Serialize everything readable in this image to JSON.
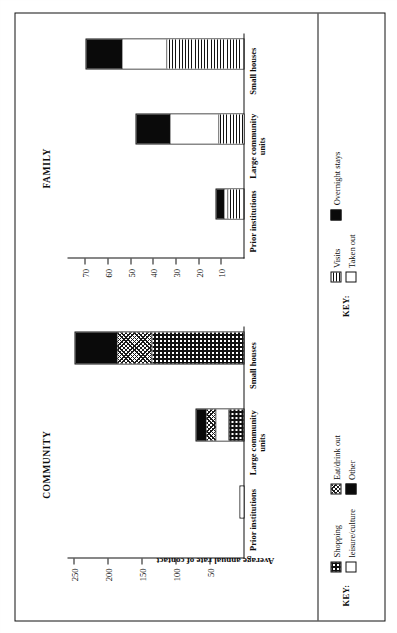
{
  "figure": {
    "y_axis_title": "Average annual rate of contact",
    "key_title_community": "KEY:",
    "key_title_family": "KEY:"
  },
  "panels": [
    {
      "id": "community",
      "title": "COMMUNITY",
      "ticks": [
        "250",
        "200",
        "150",
        "100",
        "50"
      ],
      "categories": [
        "Prior institutions",
        "Large community units",
        "Small houses"
      ],
      "key": [
        {
          "label": "Shopping",
          "pattern": "fill-shopping"
        },
        {
          "label": "leisure/culture",
          "pattern": "fill-white"
        },
        {
          "label": "Eat/drink out",
          "pattern": "fill-eatdrink"
        },
        {
          "label": "Other",
          "pattern": "fill-other"
        }
      ]
    },
    {
      "id": "family",
      "title": "FAMILY",
      "ticks": [
        "70",
        "60",
        "50",
        "40",
        "30",
        "20",
        "10"
      ],
      "categories": [
        "Prior institutions",
        "Large community units",
        "Small houses"
      ],
      "key": [
        {
          "label": "Visits",
          "pattern": "fill-visits"
        },
        {
          "label": "Taken out",
          "pattern": "fill-white"
        },
        {
          "label": "Overnight stays",
          "pattern": "fill-black"
        }
      ]
    }
  ],
  "chart_data": [
    {
      "type": "bar",
      "stacked": true,
      "panel": "COMMUNITY",
      "title": "COMMUNITY",
      "xlabel": "",
      "ylabel": "Average annual rate of contact",
      "ylim": [
        0,
        260
      ],
      "yticks": [
        50,
        100,
        150,
        200,
        250
      ],
      "grid": false,
      "legend_position": "bottom-left",
      "categories": [
        "Prior institutions",
        "Large community units",
        "Small houses"
      ],
      "series": [
        {
          "name": "Shopping",
          "values": [
            0,
            22,
            135
          ]
        },
        {
          "name": "leisure/culture",
          "values": [
            8,
            20,
            0
          ]
        },
        {
          "name": "Eat/drink out",
          "values": [
            0,
            14,
            52
          ]
        },
        {
          "name": "Other",
          "values": [
            0,
            16,
            63
          ]
        }
      ],
      "totals": [
        8,
        72,
        250
      ]
    },
    {
      "type": "bar",
      "stacked": true,
      "panel": "FAMILY",
      "title": "FAMILY",
      "xlabel": "",
      "ylabel": "Average annual rate of contact",
      "ylim": [
        0,
        78
      ],
      "yticks": [
        10,
        20,
        30,
        40,
        50,
        60,
        70
      ],
      "grid": false,
      "legend_position": "bottom-right",
      "categories": [
        "Prior institutions",
        "Large community units",
        "Small houses"
      ],
      "series": [
        {
          "name": "Visits",
          "values": [
            7,
            11,
            34
          ]
        },
        {
          "name": "Taken out",
          "values": [
            2,
            22,
            20
          ]
        },
        {
          "name": "Overnight stays",
          "values": [
            4,
            15,
            16
          ]
        }
      ],
      "totals": [
        13,
        48,
        70
      ]
    }
  ]
}
